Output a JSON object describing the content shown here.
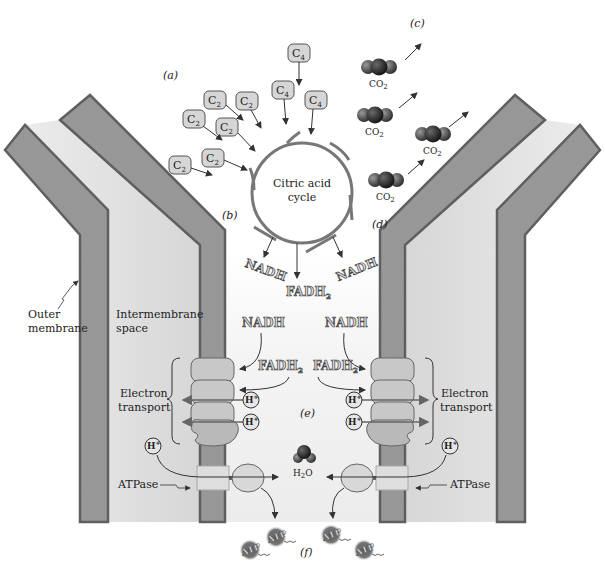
{
  "figure": {
    "panel_labels": {
      "a": "(a)",
      "b": "(b)",
      "c": "(c)",
      "d": "(d)",
      "e": "(e)",
      "f": "(f)"
    },
    "cycle": {
      "line1": "Citric acid",
      "line2": "cycle"
    },
    "substrates": {
      "c2_main": "C",
      "c2_sub": "2",
      "c4_main": "C",
      "c4_sub": "4",
      "c2_count": 6,
      "c4_count": 3
    },
    "co2": {
      "main": "CO",
      "sub": "2",
      "count": 4
    },
    "cycle_products": {
      "nadh_left": "NADH",
      "nadh_right": "NADH",
      "fadh2_main": "FADH",
      "fadh2_sub": "2"
    },
    "electron_transport_inputs": {
      "nadh_left": "NADH",
      "nadh_right": "NADH",
      "fadh2_left_main": "FADH",
      "fadh2_left_sub": "2",
      "fadh2_right_main": "FADH",
      "fadh2_right_sub": "2"
    },
    "labels": {
      "outer_membrane_1": "Outer",
      "outer_membrane_2": "membrane",
      "intermembrane_1": "Intermembrane",
      "intermembrane_2": "space",
      "electron_transport_left_1": "Electron",
      "electron_transport_left_2": "transport",
      "electron_transport_right_1": "Electron",
      "electron_transport_right_2": "transport",
      "atpase_left": "ATPase",
      "atpase_right": "ATPase"
    },
    "proton": {
      "main": "H",
      "sup": "+"
    },
    "water": {
      "h": "H",
      "sub": "2",
      "o": "O"
    },
    "atp": {
      "label": "ATP",
      "count": 4
    },
    "colors": {
      "membrane": "#8a8a8a",
      "membrane_head": "#5f5f5f",
      "matrix": "#f2f2f2",
      "intermembrane": "#d9d9d9",
      "protein": "#c8c8c8",
      "arrow": "#333333",
      "molecule": "#3a3a3a"
    }
  }
}
